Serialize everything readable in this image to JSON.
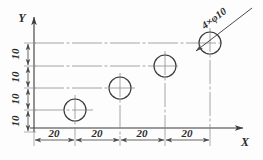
{
  "drawing": {
    "title": "Hole Pattern Layout Drawing",
    "background_color": "#fdfdfd",
    "line_color": "#4a4a4a",
    "center_line_color": "#8a8a8a",
    "text_color": "#2b2b2b",
    "axes": {
      "x_label": "X",
      "y_label": "Y",
      "origin_label": ""
    },
    "callout": {
      "text": "4×φ10",
      "quantity": 4,
      "diameter": 10,
      "symbol": "φ"
    },
    "x_dimensions": [
      {
        "value": "20"
      },
      {
        "value": "20"
      },
      {
        "value": "20"
      },
      {
        "value": "20"
      }
    ],
    "y_dimensions": [
      {
        "value": "10"
      },
      {
        "value": "10"
      },
      {
        "value": "10"
      },
      {
        "value": "10"
      }
    ],
    "holes": [
      {
        "label": "hole-1",
        "cx": 75,
        "cy": 110,
        "r": 11
      },
      {
        "label": "hole-2",
        "cx": 120,
        "cy": 88,
        "r": 11
      },
      {
        "label": "hole-3",
        "cx": 165,
        "cy": 66,
        "r": 11
      },
      {
        "label": "hole-4",
        "cx": 210,
        "cy": 43,
        "r": 11
      }
    ],
    "geometry": {
      "y_axis_x": 34,
      "x_axis_y": 128,
      "x_dim_line_y": 140,
      "y_dim_line_x": 28,
      "center_lines_y": [
        43,
        66,
        88,
        110
      ],
      "center_lines_x": [
        75,
        120,
        165,
        210
      ]
    }
  }
}
